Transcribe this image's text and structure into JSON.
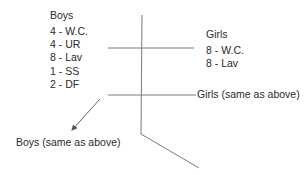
{
  "diagram": {
    "boys_block": {
      "title": "Boys",
      "items": [
        "4 - W.C.",
        "4 - UR",
        "8 - Lav",
        "1 - SS",
        "2 - DF"
      ]
    },
    "girls_block": {
      "title": "Girls",
      "items": [
        "8 - W.C.",
        "8 - Lav"
      ]
    },
    "girls_same_label": "Girls (same as above)",
    "boys_same_label": "Boys (same as above)",
    "line_color": "#7a7a7a"
  }
}
